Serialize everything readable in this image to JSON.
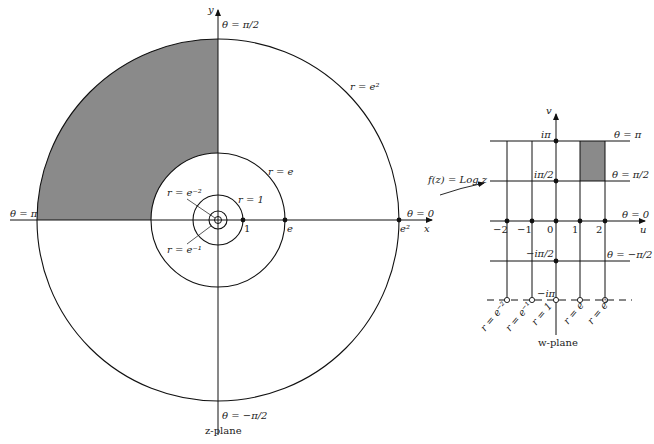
{
  "z_plane": {
    "caption": "z-plane",
    "axis_x_label": "x",
    "axis_y_label": "y",
    "theta_labels": {
      "top": "θ = π/2",
      "bottom": "θ = −π/2",
      "left": "θ = π",
      "right": "θ = 0"
    },
    "circle_labels": {
      "e2": "r = e²",
      "e": "r = e",
      "one": "r = 1",
      "e_minus1": "r = e⁻¹",
      "e_minus2": "r = e⁻²"
    },
    "point_labels": {
      "one": "1",
      "e": "e",
      "e2": "e²"
    },
    "shaded_region": "quadrant II, 1 < r < e² (between r=e and r=e² in upper-left)",
    "shade_color": "#8a8a8a"
  },
  "mapping": {
    "label": "f(z) = Log z"
  },
  "w_plane": {
    "caption": "w-plane",
    "axis_u_label": "u",
    "axis_v_label": "v",
    "u_ticks": [
      "−2",
      "−1",
      "0",
      "1",
      "2"
    ],
    "v_ticks": {
      "pi": "iπ",
      "half_pi": "iπ/2",
      "neg_half_pi": "−iπ/2",
      "neg_pi": "−iπ"
    },
    "theta_labels": {
      "pi": "θ = π",
      "half_pi": "θ = π/2",
      "zero": "θ = 0",
      "neg_half_pi": "θ = −π/2"
    },
    "r_labels": [
      "r = e⁻²",
      "r = e⁻¹",
      "r = 1",
      "r = e",
      "r = e²"
    ],
    "shade_color": "#8a8a8a"
  }
}
